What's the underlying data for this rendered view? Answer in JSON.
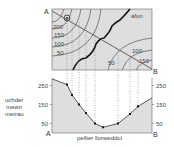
{
  "map": {
    "corner_a": "A",
    "corner_b": "B",
    "river_label": "afon",
    "contours_left": [
      "200",
      "150",
      "100",
      "50"
    ],
    "contours_right": [
      "100",
      "150",
      "50"
    ],
    "colors": {
      "fill": "#dedede",
      "line": "#555555",
      "river": "#111111"
    }
  },
  "profile": {
    "corner_a": "A",
    "corner_b": "B",
    "y_axis_label": [
      "uchder",
      "mewn",
      "metrau"
    ],
    "x_axis_label": "pellter llorweddol",
    "y_ticks_left": [
      "250",
      "150",
      "50"
    ],
    "y_ticks_right": [
      "250",
      "150",
      "50"
    ],
    "ylim": [
      0,
      300
    ],
    "points": [
      {
        "d": 0,
        "h": 285
      },
      {
        "d": 15,
        "h": 255
      },
      {
        "d": 20,
        "h": 200
      },
      {
        "d": 27,
        "h": 150
      },
      {
        "d": 34,
        "h": 105
      },
      {
        "d": 43,
        "h": 50
      },
      {
        "d": 51,
        "h": 30
      },
      {
        "d": 66,
        "h": 50
      },
      {
        "d": 78,
        "h": 100
      },
      {
        "d": 86,
        "h": 140
      },
      {
        "d": 100,
        "h": 185
      }
    ],
    "colors": {
      "fill": "#dedede",
      "line": "#333333"
    }
  }
}
